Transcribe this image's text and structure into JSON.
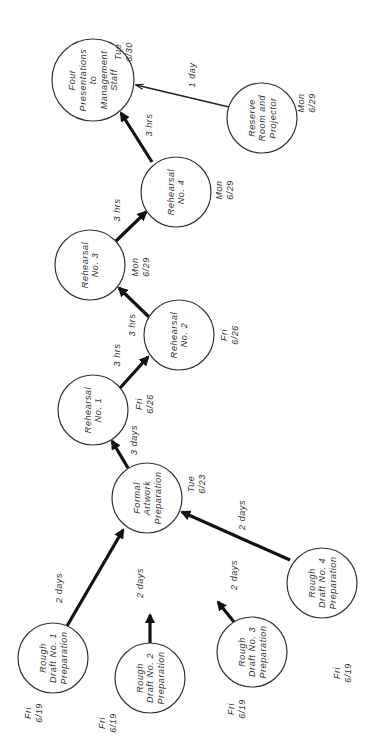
{
  "diagram": {
    "type": "PERT network",
    "orientation": "rotated 90 degrees counter-clockwise",
    "colors": {
      "line": "#111111",
      "text": "#333333",
      "background": "#ffffff"
    },
    "nodes": [
      {
        "id": "four_presentations",
        "lines": [
          "Four",
          "Presentations",
          "to",
          "Management",
          "Staff"
        ],
        "day": "Tue",
        "date": "6/30",
        "cx": 93,
        "cy": 80,
        "r": 41,
        "dx": 30,
        "dy": -28
      },
      {
        "id": "reserve_room",
        "lines": [
          "Reserve",
          "Room and",
          "Projector"
        ],
        "day": "Mon",
        "date": "6/29",
        "cx": 262,
        "cy": 118,
        "r": 35,
        "dx": 44,
        "dy": -15
      },
      {
        "id": "rehearsal_4",
        "lines": [
          "Rehearsal",
          "No. 4"
        ],
        "day": "Mon",
        "date": "6/29",
        "cx": 176,
        "cy": 192,
        "r": 35,
        "dx": 48,
        "dy": -2
      },
      {
        "id": "rehearsal_3",
        "lines": [
          "Rehearsal",
          "No. 3"
        ],
        "day": "Mon",
        "date": "6/29",
        "cx": 90,
        "cy": 265,
        "r": 35,
        "dx": 50,
        "dy": 2
      },
      {
        "id": "rehearsal_2",
        "lines": [
          "Rehearsal",
          "No. 2"
        ],
        "day": "Fri",
        "date": "6/26",
        "cx": 179,
        "cy": 335,
        "r": 35,
        "dx": 50,
        "dy": 0
      },
      {
        "id": "rehearsal_1",
        "lines": [
          "Rehearsal",
          "No. 1"
        ],
        "day": "Fri",
        "date": "6/26",
        "cx": 93,
        "cy": 410,
        "r": 35,
        "dx": 51,
        "dy": -6
      },
      {
        "id": "formal_artwork",
        "lines": [
          "Formal",
          "Artwork",
          "Preparation"
        ],
        "day": "Tue",
        "date": "6/23",
        "cx": 147,
        "cy": 498,
        "r": 35,
        "dx": 49,
        "dy": -14
      },
      {
        "id": "rough_1",
        "lines": [
          "Rough",
          "Draft No. 1",
          "Preparation"
        ],
        "day": "Fri",
        "date": "6/19",
        "cx": 53,
        "cy": 658,
        "r": 35,
        "dx": -20,
        "dy": 55
      },
      {
        "id": "rough_2",
        "lines": [
          "Rough",
          "Draft No. 2",
          "Preparation"
        ],
        "day": "Fri",
        "date": "6/19",
        "cx": 150,
        "cy": 678,
        "r": 35,
        "dx": -43,
        "dy": 45
      },
      {
        "id": "rough_3",
        "lines": [
          "Rough",
          "Draft No. 3",
          "Preparation"
        ],
        "day": "Fri",
        "date": "6/19",
        "cx": 252,
        "cy": 652,
        "r": 35,
        "dx": -16,
        "dy": 57
      },
      {
        "id": "rough_4",
        "lines": [
          "Rough",
          "Draft No. 4",
          "Preparation"
        ],
        "day": "Fri",
        "date": "6/19",
        "cx": 322,
        "cy": 583,
        "r": 35,
        "dx": 20,
        "dy": 90
      }
    ],
    "edges": [
      {
        "from": "reserve_room",
        "to": "four_presentations",
        "duration": "1 day",
        "style": "thin",
        "x1": 229,
        "y1": 107,
        "x2": 136,
        "y2": 85,
        "lx": 195,
        "ly": 75
      },
      {
        "from": "rehearsal_4",
        "to": "four_presentations",
        "duration": "3 hrs",
        "style": "thick",
        "x1": 152,
        "y1": 162,
        "x2": 121,
        "y2": 113,
        "lx": 152,
        "ly": 125
      },
      {
        "from": "rehearsal_3",
        "to": "rehearsal_4",
        "duration": "3 hrs",
        "style": "thick",
        "x1": 116,
        "y1": 241,
        "x2": 146,
        "y2": 212,
        "lx": 120,
        "ly": 210
      },
      {
        "from": "rehearsal_2",
        "to": "rehearsal_3",
        "duration": "3 hrs",
        "style": "thick",
        "x1": 149,
        "y1": 317,
        "x2": 119,
        "y2": 288,
        "lx": 135,
        "ly": 325
      },
      {
        "from": "rehearsal_1",
        "to": "rehearsal_2",
        "duration": "3 hrs",
        "style": "thick",
        "x1": 120,
        "y1": 388,
        "x2": 148,
        "y2": 357,
        "lx": 120,
        "ly": 355
      },
      {
        "from": "formal_artwork",
        "to": "rehearsal_1",
        "duration": "3 days",
        "style": "thick",
        "x1": 128,
        "y1": 468,
        "x2": 112,
        "y2": 441,
        "lx": 137,
        "ly": 440
      },
      {
        "from": "rough_1",
        "to": "formal_artwork",
        "duration": "2 days",
        "style": "thick",
        "x1": 67,
        "y1": 626,
        "x2": 123,
        "y2": 530,
        "lx": 62,
        "ly": 588
      },
      {
        "from": "rough_2",
        "to": "formal_artwork",
        "duration": "2 days",
        "style": "thick",
        "x1": 150,
        "y1": 643,
        "x2": 150,
        "y2": 615,
        "lx": 143,
        "ly": 583
      },
      {
        "from": "rough_3",
        "to": "formal_artwork",
        "duration": "2 days",
        "style": "thick",
        "x1": 234,
        "y1": 622,
        "x2": 218,
        "y2": 602,
        "lx": 237,
        "ly": 575
      },
      {
        "from": "rough_4",
        "to": "formal_artwork",
        "duration": "2 days",
        "style": "thick",
        "x1": 290,
        "y1": 560,
        "x2": 182,
        "y2": 512,
        "lx": 245,
        "ly": 515
      }
    ]
  }
}
